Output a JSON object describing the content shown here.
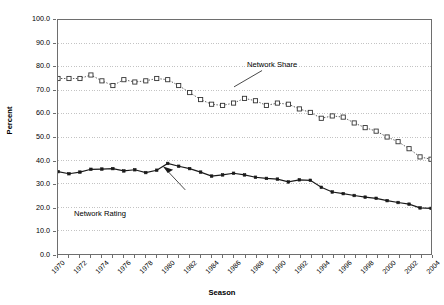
{
  "chart_data": {
    "type": "line",
    "title": "",
    "xlabel": "Season",
    "ylabel": "Percent",
    "ylim": [
      0,
      100
    ],
    "ytick_step": 10,
    "yticks": [
      "0.0",
      "10.0",
      "20.0",
      "30.0",
      "40.0",
      "50.0",
      "60.0",
      "70.0",
      "80.0",
      "90.0",
      "100.0"
    ],
    "grid": "horizontal-dotted",
    "legend": "none",
    "annotations": [
      {
        "text": "Network Share",
        "x": 1986,
        "y": 71
      },
      {
        "text": "Network Rating",
        "x": 1981,
        "y": 30
      }
    ],
    "x": [
      1970,
      1971,
      1972,
      1973,
      1974,
      1975,
      1976,
      1977,
      1978,
      1979,
      1980,
      1981,
      1982,
      1983,
      1984,
      1985,
      1986,
      1987,
      1988,
      1989,
      1990,
      1991,
      1992,
      1993,
      1994,
      1995,
      1996,
      1997,
      1998,
      1999,
      2000,
      2001,
      2002,
      2003,
      2004
    ],
    "xtick_labels": [
      "1970",
      "1972",
      "1974",
      "1976",
      "1978",
      "1980",
      "1982",
      "1984",
      "1986",
      "1988",
      "1990",
      "1992",
      "1994",
      "1996",
      "1998",
      "2000",
      "2002",
      "2004"
    ],
    "series": [
      {
        "name": "Network Share",
        "marker": "open-square",
        "line": "dotted",
        "values": [
          75,
          75,
          75,
          76.5,
          74,
          72,
          74.5,
          73.5,
          74,
          75,
          74.5,
          72,
          69,
          66,
          64,
          63.5,
          64.5,
          66.5,
          65.5,
          63.5,
          64.5,
          64,
          62,
          60.5,
          58,
          59,
          58.5,
          56,
          54,
          52.5,
          50,
          48,
          45,
          41.5,
          40.5
        ]
      },
      {
        "name": "Network Rating",
        "marker": "filled-diamond",
        "line": "solid",
        "values": [
          35.2,
          34.3,
          35,
          36.2,
          36.3,
          36.5,
          35.5,
          36,
          34.8,
          35.8,
          38.7,
          37.5,
          36.5,
          35,
          33.3,
          33.8,
          34.5,
          33.8,
          32.8,
          32.3,
          32,
          30.8,
          31.7,
          31.5,
          28.5,
          26.5,
          25.8,
          25,
          24.3,
          23.8,
          22.8,
          22,
          21.3,
          19.7,
          19.5
        ]
      }
    ]
  },
  "annotations": {
    "network_share": "Network Share",
    "network_rating": "Network Rating"
  },
  "axes": {
    "ylabel": "Percent",
    "xlabel": "Season"
  },
  "colors": {
    "background": "#ffffff",
    "axis": "#6e6e6e",
    "grid": "#b4b4b4",
    "series_share": "#333333",
    "series_rating": "#1a1a1a"
  }
}
